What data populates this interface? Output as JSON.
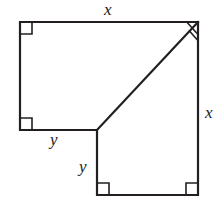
{
  "figure": {
    "stroke_color": "#231f20",
    "background_color": "#ffffff",
    "stroke_width": 2.2,
    "labels": {
      "x_top": "x",
      "x_right": "x",
      "y_left": "y",
      "y_lower": "y"
    },
    "vertices": {
      "top_left": [
        20,
        22
      ],
      "top_right": [
        198,
        22
      ],
      "left_bottom": [
        20,
        130
      ],
      "junction": [
        97,
        130
      ],
      "lower_left": [
        97,
        195
      ],
      "lower_right": [
        198,
        195
      ]
    },
    "outline_path": "M20,22 L198,22 L198,195 L97,195 L97,130 L20,130 Z",
    "diagonal_path": "M97,130 L198,22",
    "right_angle_marks": [
      {
        "name": "top-left-angle-mark",
        "at": [
          20,
          22
        ]
      },
      {
        "name": "top-right-angle-mark",
        "at": [
          198,
          22
        ]
      },
      {
        "name": "left-bottom-angle-mark",
        "at": [
          20,
          130
        ]
      },
      {
        "name": "lower-left-angle-mark",
        "at": [
          97,
          195
        ]
      },
      {
        "name": "lower-right-angle-mark",
        "at": [
          198,
          195
        ]
      }
    ]
  }
}
